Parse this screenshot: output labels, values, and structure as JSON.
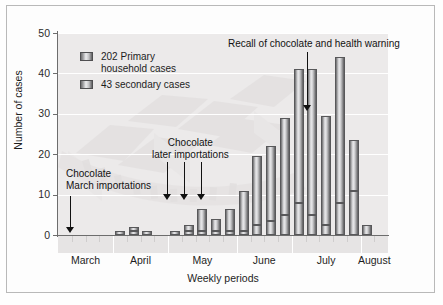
{
  "chart_data": {
    "type": "bar",
    "title": "",
    "subtitle": "",
    "xlabel": "Weekly periods",
    "ylabel": "Number of cases",
    "ylim": [
      0,
      50
    ],
    "yticks": [
      0,
      10,
      20,
      30,
      40,
      50
    ],
    "grid": true,
    "stacked": true,
    "legend_position": "upper-left",
    "categories": [
      "Mar wk1",
      "Mar wk2",
      "Mar wk3",
      "Mar wk4",
      "Apr wk1",
      "Apr wk2",
      "Apr wk3",
      "Apr wk4",
      "May wk1",
      "May wk2",
      "May wk3",
      "May wk4",
      "May wk5",
      "Jun wk1",
      "Jun wk2",
      "Jun wk3",
      "Jun wk4",
      "Jul wk1",
      "Jul wk2",
      "Jul wk3",
      "Jul wk4",
      "Jul wk5",
      "Aug wk1",
      "Aug wk2"
    ],
    "series": [
      {
        "name": "43 secondary cases",
        "values": [
          0,
          0,
          0,
          0,
          1,
          1,
          0,
          0,
          1,
          1,
          1,
          1,
          1,
          1,
          2.5,
          3.5,
          5,
          8,
          5,
          2.5,
          8,
          11,
          0,
          0
        ]
      },
      {
        "name": "202 Primary household cases",
        "values": [
          0,
          0,
          0,
          0,
          0,
          1,
          1,
          0,
          0,
          1.5,
          5.5,
          3,
          5.5,
          10,
          17,
          18.5,
          24,
          33,
          36,
          27,
          36,
          12.5,
          2.5,
          0
        ]
      }
    ],
    "totals": [
      0,
      0,
      0,
      0,
      1,
      2,
      1,
      0,
      1,
      2.5,
      6.5,
      4,
      6.5,
      11,
      19.5,
      22,
      29,
      41,
      41,
      29.5,
      44,
      23.5,
      2.5,
      0
    ],
    "month_groups": [
      "March",
      "April",
      "May",
      "June",
      "July",
      "August"
    ],
    "annotations": [
      "Chocolate March importations",
      "Chocolate later importations",
      "Recall of chocolate and health warning"
    ]
  },
  "axes": {
    "y_label": "Number of cases",
    "x_label": "Weekly periods",
    "y_ticks": [
      "50",
      "40",
      "30",
      "20",
      "10",
      "0"
    ],
    "month_labels": [
      "March",
      "April",
      "May",
      "June",
      "July",
      "August"
    ]
  },
  "legend": {
    "items": [
      {
        "line1": "202 Primary",
        "line2": "household cases"
      },
      {
        "line1": "43 secondary cases",
        "line2": ""
      }
    ]
  },
  "annotations": {
    "march": {
      "line1": "Chocolate",
      "line2": "March importations"
    },
    "later": {
      "line1": "Chocolate",
      "line2": "later importations"
    },
    "recall": {
      "line1": "Recall of chocolate and health warning"
    }
  },
  "colors": {
    "plot_background": "#eceaea",
    "gridline": "#ffffff",
    "axis": "#6d6d6d",
    "bar_dark": "#58585a",
    "bar_light": "#e8e8ea",
    "text": "#1d1d1d",
    "frame": "#b9b9b9"
  }
}
